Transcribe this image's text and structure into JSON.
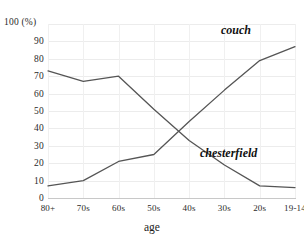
{
  "chart_data": {
    "type": "line",
    "title": "",
    "xlabel": "age",
    "ylabel": "100 (%)",
    "categories": [
      "80+",
      "70s",
      "60s",
      "50s",
      "40s",
      "30s",
      "20s",
      "19-14"
    ],
    "ylim": [
      0,
      100
    ],
    "ytick_labels": [
      "0",
      "10",
      "20",
      "30",
      "40",
      "50",
      "60",
      "70",
      "80",
      "90",
      "100 (%)"
    ],
    "ytick_values": [
      0,
      10,
      20,
      30,
      40,
      50,
      60,
      70,
      80,
      90,
      100
    ],
    "grid": true,
    "legend_position": "inline-annotation",
    "series": [
      {
        "name": "chesterfield",
        "values": [
          73,
          67,
          70,
          51,
          33,
          19,
          7,
          6
        ],
        "color": "#555555"
      },
      {
        "name": "couch",
        "values": [
          7,
          10,
          21,
          25,
          44,
          62,
          79,
          87
        ],
        "color": "#555555"
      }
    ],
    "annotations": [
      {
        "text": "couch",
        "near_category": "20s"
      },
      {
        "text": "chesterfield",
        "near_category": "30s"
      }
    ]
  },
  "colors": {
    "background": "#ffffff",
    "grid": "#ececec",
    "axis": "#c8c8c8",
    "line": "#555555",
    "text": "#1c1c1c"
  }
}
